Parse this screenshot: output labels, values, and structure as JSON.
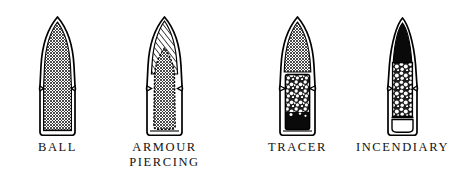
{
  "figure": {
    "background_color": "#ffffff",
    "ink_color": "#000000",
    "width": 460,
    "height": 180
  },
  "bullets": [
    {
      "id": "ball",
      "label": "BALL",
      "label_lines": "BALL",
      "description": "Jacketed bullet with solid cross-hatched lead core filling the full length",
      "components": [
        {
          "name": "jacket",
          "fill": "outline-white"
        },
        {
          "name": "lead-core",
          "fill": "cross-hatch"
        },
        {
          "name": "cannelure-groove",
          "fill": "outline"
        }
      ]
    },
    {
      "id": "armour-piercing",
      "label": "ARMOUR PIERCING",
      "label_lines": "ARMOUR\nPIERCING",
      "description": "Jacket with diagonally hatched nose filler over a pointed hardened steel penetrator core",
      "components": [
        {
          "name": "jacket",
          "fill": "outline-white"
        },
        {
          "name": "nose-filler",
          "fill": "diagonal-hatch"
        },
        {
          "name": "steel-penetrator-core",
          "fill": "cross-hatch"
        },
        {
          "name": "cannelure-groove",
          "fill": "outline"
        }
      ]
    },
    {
      "id": "tracer",
      "label": "TRACER",
      "label_lines": "TRACER",
      "description": "Jacket with cross-hatched lead nose core, granular tracer composition and solid igniter at the base",
      "components": [
        {
          "name": "jacket",
          "fill": "outline-white"
        },
        {
          "name": "lead-core",
          "fill": "cross-hatch"
        },
        {
          "name": "tracer-composition",
          "fill": "granular"
        },
        {
          "name": "igniter-charge",
          "fill": "solid-black"
        },
        {
          "name": "cannelure-groove",
          "fill": "outline"
        }
      ]
    },
    {
      "id": "incendiary",
      "label": "INCENDIARY",
      "label_lines": "INCENDIARY",
      "description": "Jacket with solid black nose cavity, granular incendiary composition column and hollow base cavity",
      "components": [
        {
          "name": "jacket",
          "fill": "outline-white"
        },
        {
          "name": "nose-cavity",
          "fill": "solid-black"
        },
        {
          "name": "incendiary-composition",
          "fill": "granular"
        },
        {
          "name": "base-cavity",
          "fill": "white"
        },
        {
          "name": "cannelure-groove",
          "fill": "outline"
        }
      ]
    }
  ]
}
